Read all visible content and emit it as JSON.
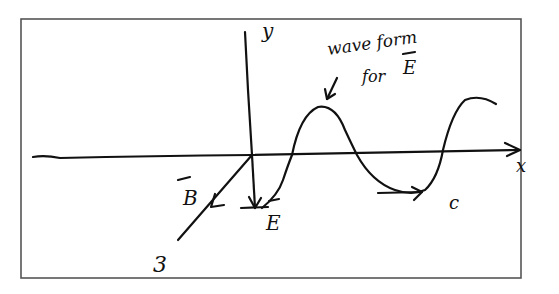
{
  "diagram": {
    "axes": {
      "x_label": "x",
      "y_label": "y",
      "z_label": "3"
    },
    "vectors": {
      "electric_field_label": "E",
      "magnetic_field_label": "B",
      "propagation_label": "c"
    },
    "annotation": {
      "line1": "wave form",
      "line2": "for",
      "line3": "E"
    },
    "colors": {
      "ink": "#111111",
      "frame": "#555555",
      "background": "#ffffff"
    }
  }
}
